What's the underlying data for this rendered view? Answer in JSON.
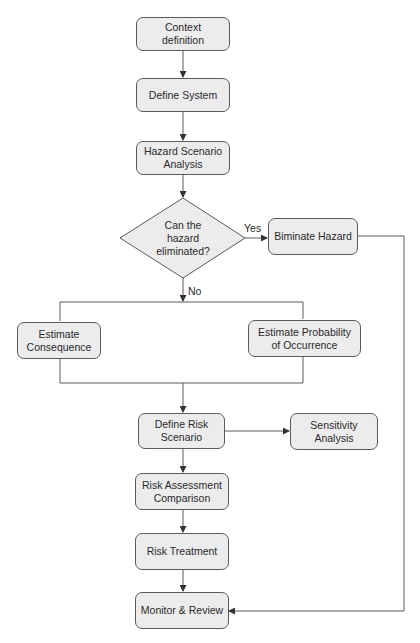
{
  "diagram": {
    "type": "flowchart",
    "nodes": {
      "context_definition": {
        "label": "Context definition",
        "line1": "Context",
        "line2": "definition",
        "shape": "rounded-rect"
      },
      "define_system": {
        "label": "Define System",
        "shape": "rounded-rect"
      },
      "hazard_scenario_analysis": {
        "label": "Hazard Scenario Analysis",
        "line1": "Hazard Scenario",
        "line2": "Analysis",
        "shape": "rounded-rect"
      },
      "decision": {
        "label": "Can the hazard eliminated?",
        "line1": "Can the",
        "line2": "hazard",
        "line3": "eliminated?",
        "shape": "diamond"
      },
      "eliminate_hazard": {
        "label": "Biminate Hazard",
        "shape": "rounded-rect"
      },
      "estimate_consequence": {
        "label": "Estimate Consequence",
        "line1": "Estimate",
        "line2": "Consequence",
        "shape": "rounded-rect"
      },
      "estimate_probability": {
        "label": "Estimate Probability of Occurrence",
        "line1": "Estimate Probability",
        "line2": "of Occurrence",
        "shape": "rounded-rect"
      },
      "define_risk_scenario": {
        "label": "Define Risk Scenario",
        "line1": "Define Risk",
        "line2": "Scenario",
        "shape": "rounded-rect"
      },
      "sensitivity_analysis": {
        "label": "Sensitivity Analysis",
        "line1": "Sensitivity",
        "line2": "Analysis",
        "shape": "rounded-rect"
      },
      "risk_assessment_comparison": {
        "label": "Risk Assessment Comparison",
        "line1": "Risk Assessment",
        "line2": "Comparison",
        "shape": "rounded-rect"
      },
      "risk_treatment": {
        "label": "Risk Treatment",
        "shape": "rounded-rect"
      },
      "monitor_review": {
        "label": "Monitor & Review",
        "shape": "rounded-rect"
      }
    },
    "edge_labels": {
      "yes": "Yes",
      "no": "No"
    },
    "edges": [
      {
        "from": "Context definition",
        "to": "Define System"
      },
      {
        "from": "Define System",
        "to": "Hazard Scenario Analysis"
      },
      {
        "from": "Hazard Scenario Analysis",
        "to": "Can the hazard eliminated?"
      },
      {
        "from": "Can the hazard eliminated?",
        "to": "Biminate Hazard",
        "label": "Yes"
      },
      {
        "from": "Can the hazard eliminated?",
        "to": "Estimate Consequence / Estimate Probability of Occurrence",
        "label": "No"
      },
      {
        "from": "Estimate Consequence / Estimate Probability of Occurrence",
        "to": "Define Risk Scenario"
      },
      {
        "from": "Define Risk Scenario",
        "to": "Sensitivity Analysis"
      },
      {
        "from": "Define Risk Scenario",
        "to": "Risk Assessment Comparison"
      },
      {
        "from": "Risk Assessment Comparison",
        "to": "Risk Treatment"
      },
      {
        "from": "Risk Treatment",
        "to": "Monitor & Review"
      },
      {
        "from": "Biminate Hazard",
        "to": "Monitor & Review"
      }
    ],
    "colors": {
      "box_fill": "#ececec",
      "stroke": "#5a5a5a",
      "text": "#2a2a2a",
      "background": "#ffffff"
    }
  }
}
